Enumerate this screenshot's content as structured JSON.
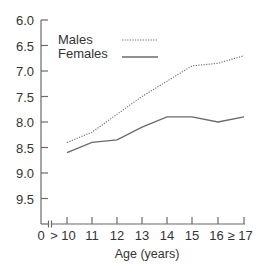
{
  "chart_data": {
    "type": "line",
    "title": "",
    "xlabel": "Age (years)",
    "ylabel": "",
    "y_inverted": true,
    "ylim": [
      6.0,
      10.0
    ],
    "y_ticks": [
      "6.0",
      "6.5",
      "7.0",
      "7.5",
      "8.0",
      "8.5",
      "9.0",
      "9.5"
    ],
    "x_tick_labels": [
      "0",
      "> 10",
      "11",
      "12",
      "13",
      "14",
      "15",
      "16",
      "≥ 17"
    ],
    "categories": [
      "10",
      "11",
      "12",
      "13",
      "14",
      "15",
      "16",
      "≥17"
    ],
    "axis_break": true,
    "grid": false,
    "legend_position": "upper-left",
    "series": [
      {
        "name": "Males",
        "style": "dotted",
        "values": [
          8.4,
          8.2,
          7.85,
          7.5,
          7.2,
          6.9,
          6.85,
          6.7
        ]
      },
      {
        "name": "Females",
        "style": "solid",
        "values": [
          8.6,
          8.4,
          8.35,
          8.1,
          7.9,
          7.9,
          8.0,
          7.9
        ]
      }
    ]
  },
  "legend": {
    "males": "Males",
    "females": "Females"
  },
  "axes": {
    "x_title": "Age (years)",
    "y_ticks": [
      "6.0",
      "6.5",
      "7.0",
      "7.5",
      "8.0",
      "8.5",
      "9.0",
      "9.5"
    ],
    "x_zero": "0",
    "x_ticks": [
      "> 10",
      "11",
      "12",
      "13",
      "14",
      "15",
      "16 ≥ 17"
    ]
  }
}
